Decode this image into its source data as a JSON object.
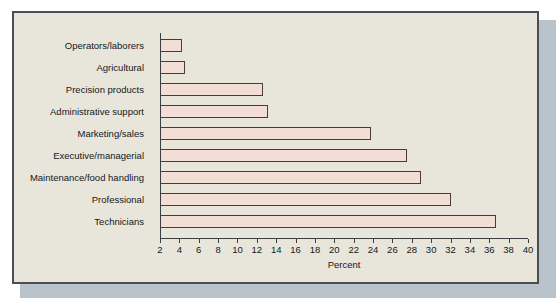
{
  "chart_data": {
    "type": "bar",
    "orientation": "horizontal",
    "title": "",
    "xlabel": "Percent",
    "ylabel": "",
    "xlim": [
      2,
      40
    ],
    "xticks": [
      2,
      4,
      6,
      8,
      10,
      12,
      14,
      16,
      18,
      20,
      22,
      24,
      26,
      28,
      30,
      32,
      34,
      36,
      38,
      40
    ],
    "grid": false,
    "legend": false,
    "categories": [
      "Operators/laborers",
      "Agricultural",
      "Precision products",
      "Administrative support",
      "Marketing/sales",
      "Executive/managerial",
      "Maintenance/food handling",
      "Professional",
      "Technicians"
    ],
    "values": [
      4.3,
      4.6,
      12.6,
      13.2,
      23.8,
      27.5,
      29.0,
      32.1,
      36.7
    ],
    "bar_fill_color": "#f3ded6",
    "bar_edge_color": "#4a3b38",
    "panel_background_color": "#e8e6da",
    "axis_color": "#3b3f42",
    "shadow_color": "#b9c3cc"
  }
}
